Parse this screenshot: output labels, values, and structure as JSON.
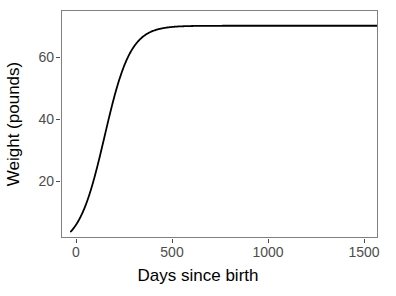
{
  "chart_data": {
    "type": "line",
    "title": "",
    "xlabel": "Days since birth",
    "ylabel": "Weight (pounds)",
    "xlim": [
      -45,
      1545
    ],
    "ylim": [
      3.2,
      76.8
    ],
    "xticks": [
      0,
      500,
      1000,
      1500
    ],
    "xtick_labels": [
      "0",
      "500",
      "1000",
      "1500"
    ],
    "yticks": [
      20,
      40,
      60
    ],
    "ytick_labels": [
      "20",
      "40",
      "60"
    ],
    "grid": false,
    "legend": null,
    "series": [
      {
        "name": "growth curve",
        "color": "#000000",
        "line_width": 1.8,
        "description": "Logistic (sigmoid) growth curve rising from about 5 pounds at birth to an asymptote of about 72 pounds by roughly day 500.",
        "asymptote": 72,
        "birth_weight": 5,
        "inflection_day": 170,
        "x": [
          0,
          25,
          50,
          75,
          100,
          125,
          150,
          175,
          200,
          225,
          250,
          275,
          300,
          325,
          350,
          375,
          400,
          450,
          500,
          600,
          700,
          800,
          900,
          1000,
          1100,
          1200,
          1300,
          1400,
          1500
        ],
        "y": [
          5.0,
          6.6,
          8.8,
          11.6,
          15.3,
          19.9,
          25.5,
          32.0,
          39.0,
          46.0,
          52.5,
          58.1,
          62.5,
          65.8,
          68.1,
          69.6,
          70.6,
          71.5,
          71.8,
          72.0,
          72.0,
          72.0,
          72.0,
          72.0,
          72.0,
          72.0,
          72.0,
          72.0,
          72.0
        ]
      }
    ]
  },
  "axes": {
    "x_tick_labels": [
      "0",
      "500",
      "1000",
      "1500"
    ],
    "y_tick_labels": [
      "20",
      "40",
      "60"
    ],
    "x_title": "Days since birth",
    "y_title": "Weight (pounds)"
  },
  "style": {
    "panel_background": "#ffffff",
    "panel_border": "#808080",
    "line_color": "#000000",
    "tick_color": "#4d4d4d",
    "label_color": "#4d4d4d",
    "title_color": "#000000"
  }
}
